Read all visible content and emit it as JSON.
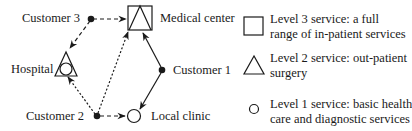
{
  "diagram": {
    "nodes": {
      "customer3": {
        "label": "Customer 3"
      },
      "customer1": {
        "label": "Customer 1"
      },
      "customer2": {
        "label": "Customer 2"
      },
      "medical_center": {
        "label": "Medical center",
        "levels": [
          3,
          2
        ]
      },
      "hospital": {
        "label": "Hospital",
        "levels": [
          2,
          1
        ]
      },
      "local_clinic": {
        "label": "Local clinic",
        "levels": [
          1
        ]
      }
    },
    "edges": [
      {
        "from": "customer3",
        "to": "medical_center",
        "style": "dashed"
      },
      {
        "from": "customer3",
        "to": "hospital",
        "style": "dashed"
      },
      {
        "from": "customer1",
        "to": "medical_center",
        "style": "solid"
      },
      {
        "from": "customer1",
        "to": "local_clinic",
        "style": "solid"
      },
      {
        "from": "customer2",
        "to": "hospital",
        "style": "dotted"
      },
      {
        "from": "customer2",
        "to": "medical_center",
        "style": "dotted"
      },
      {
        "from": "customer2",
        "to": "local_clinic",
        "style": "dashed"
      }
    ]
  },
  "legend": {
    "level3": {
      "line1": "Level 3 service: a full",
      "line2": "range of in-patient services",
      "symbol": "square"
    },
    "level2": {
      "line1": "Level 2 service: out-patient",
      "line2": "surgery",
      "symbol": "triangle"
    },
    "level1": {
      "line1": "Level 1 service: basic health",
      "line2": "care and diagnostic services",
      "symbol": "circle"
    }
  }
}
